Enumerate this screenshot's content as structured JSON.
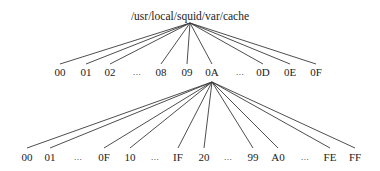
{
  "diagram": {
    "type": "directory-tree",
    "root": {
      "label": "/usr/local/squid/var/cache",
      "x": 190,
      "y": 10,
      "apex": {
        "x": 190,
        "y": 23
      }
    },
    "level1": {
      "apex": {
        "x": 212,
        "y": 82
      },
      "label_y": 66,
      "line_end_y": 64,
      "nodes": [
        {
          "label": "00",
          "x": 60,
          "linked": true
        },
        {
          "label": "01",
          "x": 86,
          "linked": true
        },
        {
          "label": "02",
          "x": 110,
          "linked": true
        },
        {
          "label": "...",
          "x": 137,
          "linked": false
        },
        {
          "label": "08",
          "x": 161,
          "linked": true
        },
        {
          "label": "09",
          "x": 187,
          "linked": true
        },
        {
          "label": "0A",
          "x": 212,
          "linked": true,
          "expanded": true
        },
        {
          "label": "...",
          "x": 240,
          "linked": false
        },
        {
          "label": "0D",
          "x": 263,
          "linked": true
        },
        {
          "label": "0E",
          "x": 290,
          "linked": true
        },
        {
          "label": "0F",
          "x": 316,
          "linked": true
        }
      ]
    },
    "level2": {
      "parent": "0A",
      "label_y": 151,
      "line_end_y": 148,
      "nodes": [
        {
          "label": "00",
          "x": 27,
          "linked": true
        },
        {
          "label": "01",
          "x": 50,
          "linked": true
        },
        {
          "label": "...",
          "x": 78,
          "linked": false
        },
        {
          "label": "0F",
          "x": 104,
          "linked": true
        },
        {
          "label": "10",
          "x": 130,
          "linked": true
        },
        {
          "label": "...",
          "x": 155,
          "linked": false
        },
        {
          "label": "IF",
          "x": 178,
          "linked": true
        },
        {
          "label": "20",
          "x": 204,
          "linked": true
        },
        {
          "label": "...",
          "x": 228,
          "linked": false
        },
        {
          "label": "99",
          "x": 253,
          "linked": true
        },
        {
          "label": "A0",
          "x": 278,
          "linked": true
        },
        {
          "label": "...",
          "x": 305,
          "linked": false
        },
        {
          "label": "FE",
          "x": 330,
          "linked": true
        },
        {
          "label": "FF",
          "x": 355,
          "linked": true
        }
      ]
    },
    "colors": {
      "line": "#3a3a3a",
      "text": "#222222",
      "background": "#ffffff"
    }
  }
}
